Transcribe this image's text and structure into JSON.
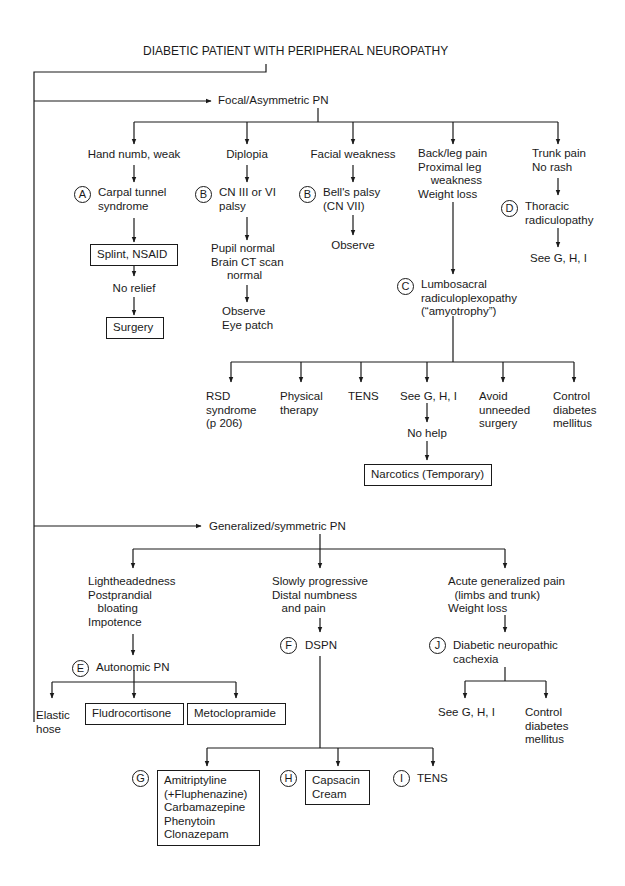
{
  "title": "DIABETIC PATIENT WITH PERIPHERAL NEUROPATHY",
  "focal": {
    "label": "Focal/Asymmetric PN",
    "branches": [
      {
        "presentation": "Hand numb, weak",
        "marker": "A",
        "diagnosis": "Carpal tunnel\nsyndrome",
        "step1": "Splint, NSAID",
        "step2": "No relief",
        "step3": "Surgery"
      },
      {
        "presentation": "Diplopia",
        "marker": "B",
        "diagnosis": "CN III or VI\npalsy",
        "step1": "Pupil normal\nBrain CT scan\n     normal",
        "step2": "Observe\nEye patch"
      },
      {
        "presentation": "Facial weakness",
        "marker": "B",
        "diagnosis": "Bell's palsy\n(CN VII)",
        "step1": "Observe"
      },
      {
        "presentation": "Back/leg pain\nProximal leg\n    weakness\nWeight loss",
        "marker": "C",
        "diagnosis": "Lumbosacral\nradiculoplexopathy\n(“amyotrophy”)",
        "treatments": [
          "RSD\nsyndrome\n(p 206)",
          "Physical\ntherapy",
          "TENS",
          "See G, H, I",
          "Avoid\nunneeded\nsurgery",
          "Control\ndiabetes\nmellitus"
        ],
        "no_help": "No help",
        "narcotics": "Narcotics (Temporary)"
      },
      {
        "presentation": "Trunk pain\nNo rash",
        "marker": "D",
        "diagnosis": "Thoracic\nradiculopathy",
        "step1": "See G, H, I"
      }
    ]
  },
  "generalized": {
    "label": "Generalized/symmetric PN",
    "branches": [
      {
        "presentation": "Lightheadedness\nPostprandial\n   bloating\nImpotence",
        "marker": "E",
        "diagnosis": "Autonomic PN",
        "treatments": [
          "Elastic\nhose",
          "Fludrocortisone",
          "Metoclopramide"
        ]
      },
      {
        "presentation": "Slowly progressive\nDistal numbness\n   and pain",
        "marker": "F",
        "diagnosis": "DSPN",
        "treatments": [
          {
            "marker": "G",
            "label": "Amitriptyline\n(+Fluphenazine)\nCarbamazepine\nPhenytoin\nClonazepam"
          },
          {
            "marker": "H",
            "label": "Capsacin\nCream"
          },
          {
            "marker": "I",
            "label": "TENS"
          }
        ]
      },
      {
        "presentation": "Acute generalized pain\n  (limbs and trunk)\nWeight loss",
        "marker": "J",
        "diagnosis": "Diabetic neuropathic\ncachexia",
        "treatments": [
          "See G, H, I",
          "Control\ndiabetes\nmellitus"
        ]
      }
    ]
  },
  "colors": {
    "ink": "#1a1a1a",
    "background": "#ffffff"
  }
}
